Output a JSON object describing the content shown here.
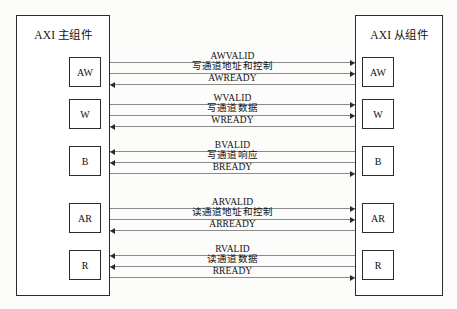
{
  "diagram": {
    "title_master": "AXI 主组件",
    "title_slave": "AXI 从组件",
    "master_label": "AXI 主组件",
    "slave_label": "AXI 从组件"
  },
  "channels": [
    {
      "id": "aw",
      "master_box": "AW",
      "slave_box": "AW",
      "signals": [
        {
          "name": "AWVALID",
          "direction": "master-to-slave"
        },
        {
          "name": "写通道地址和控制",
          "direction": "master-to-slave"
        },
        {
          "name": "AWREADY",
          "direction": "slave-to-master"
        }
      ]
    },
    {
      "id": "w",
      "master_box": "W",
      "slave_box": "W",
      "signals": [
        {
          "name": "WVALID",
          "direction": "master-to-slave"
        },
        {
          "name": "写通道数据",
          "direction": "master-to-slave"
        },
        {
          "name": "WREADY",
          "direction": "slave-to-master"
        }
      ]
    },
    {
      "id": "b",
      "master_box": "B",
      "slave_box": "B",
      "signals": [
        {
          "name": "BVALID",
          "direction": "slave-to-master"
        },
        {
          "name": "写通道响应",
          "direction": "slave-to-master"
        },
        {
          "name": "BREADY",
          "direction": "master-to-slave"
        }
      ]
    },
    {
      "id": "ar",
      "master_box": "AR",
      "slave_box": "AR",
      "signals": [
        {
          "name": "ARVALID",
          "direction": "master-to-slave"
        },
        {
          "name": "读通道地址和控制",
          "direction": "master-to-slave"
        },
        {
          "name": "ARREADY",
          "direction": "slave-to-master"
        }
      ]
    },
    {
      "id": "r",
      "master_box": "R",
      "slave_box": "R",
      "signals": [
        {
          "name": "RVALID",
          "direction": "slave-to-master"
        },
        {
          "name": "读通道数据",
          "direction": "slave-to-master"
        },
        {
          "name": "RREADY",
          "direction": "master-to-slave"
        }
      ]
    }
  ],
  "colors": {
    "border": "#2b2b2b",
    "line": "#8a8a8a",
    "background": "#fcfcfa",
    "text": "#111111"
  }
}
